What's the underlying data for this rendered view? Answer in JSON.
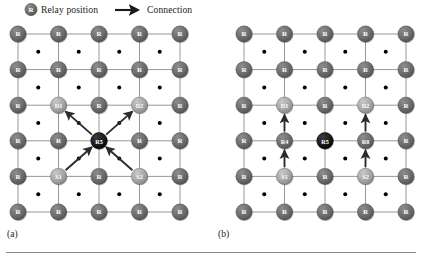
{
  "figure": {
    "legend": {
      "relay_icon_label": "R",
      "relay_label": "Relay position",
      "connection_arrow_icon": "arrow-right-icon",
      "connection_label": "Connection"
    },
    "panels": [
      {
        "id": "a",
        "caption": "(a)",
        "grid": {
          "cols": 5,
          "rows": 6
        },
        "nodes": [
          {
            "label": "R",
            "col": 0,
            "row": 0,
            "kind": "relay"
          },
          {
            "label": "R",
            "col": 1,
            "row": 0,
            "kind": "relay"
          },
          {
            "label": "R",
            "col": 2,
            "row": 0,
            "kind": "relay"
          },
          {
            "label": "R",
            "col": 3,
            "row": 0,
            "kind": "relay"
          },
          {
            "label": "R",
            "col": 4,
            "row": 0,
            "kind": "relay"
          },
          {
            "label": "R",
            "col": 0,
            "row": 1,
            "kind": "relay"
          },
          {
            "label": "R",
            "col": 1,
            "row": 1,
            "kind": "relay"
          },
          {
            "label": "R",
            "col": 2,
            "row": 1,
            "kind": "relay"
          },
          {
            "label": "R",
            "col": 3,
            "row": 1,
            "kind": "relay"
          },
          {
            "label": "R",
            "col": 4,
            "row": 1,
            "kind": "relay"
          },
          {
            "label": "R",
            "col": 0,
            "row": 2,
            "kind": "relay"
          },
          {
            "label": "D1",
            "col": 1,
            "row": 2,
            "kind": "destination"
          },
          {
            "label": "R",
            "col": 2,
            "row": 2,
            "kind": "relay"
          },
          {
            "label": "D2",
            "col": 3,
            "row": 2,
            "kind": "destination"
          },
          {
            "label": "R",
            "col": 4,
            "row": 2,
            "kind": "relay"
          },
          {
            "label": "R",
            "col": 0,
            "row": 3,
            "kind": "relay"
          },
          {
            "label": "R",
            "col": 1,
            "row": 3,
            "kind": "relay"
          },
          {
            "label": "R5",
            "col": 2,
            "row": 3,
            "kind": "active-relay"
          },
          {
            "label": "R",
            "col": 3,
            "row": 3,
            "kind": "relay"
          },
          {
            "label": "R",
            "col": 4,
            "row": 3,
            "kind": "relay"
          },
          {
            "label": "R",
            "col": 0,
            "row": 4,
            "kind": "relay"
          },
          {
            "label": "S1",
            "col": 1,
            "row": 4,
            "kind": "source"
          },
          {
            "label": "R",
            "col": 2,
            "row": 4,
            "kind": "relay"
          },
          {
            "label": "S2",
            "col": 3,
            "row": 4,
            "kind": "source"
          },
          {
            "label": "R",
            "col": 4,
            "row": 4,
            "kind": "relay"
          },
          {
            "label": "R",
            "col": 0,
            "row": 5,
            "kind": "relay"
          },
          {
            "label": "R",
            "col": 1,
            "row": 5,
            "kind": "relay"
          },
          {
            "label": "R",
            "col": 2,
            "row": 5,
            "kind": "relay"
          },
          {
            "label": "R",
            "col": 3,
            "row": 5,
            "kind": "relay"
          },
          {
            "label": "R",
            "col": 4,
            "row": 5,
            "kind": "relay"
          }
        ],
        "arrows": [
          {
            "from": "S1",
            "to": "R5",
            "from_col": 1,
            "from_row": 4,
            "to_col": 2,
            "to_row": 3
          },
          {
            "from": "S2",
            "to": "R5",
            "from_col": 3,
            "from_row": 4,
            "to_col": 2,
            "to_row": 3
          },
          {
            "from": "R5",
            "to": "D1",
            "from_col": 2,
            "from_row": 3,
            "to_col": 1,
            "to_row": 2
          },
          {
            "from": "R5",
            "to": "D2",
            "from_col": 2,
            "from_row": 3,
            "to_col": 3,
            "to_row": 2
          }
        ]
      },
      {
        "id": "b",
        "caption": "(b)",
        "grid": {
          "cols": 5,
          "rows": 6
        },
        "nodes": [
          {
            "label": "R",
            "col": 0,
            "row": 0,
            "kind": "relay"
          },
          {
            "label": "R",
            "col": 1,
            "row": 0,
            "kind": "relay"
          },
          {
            "label": "R",
            "col": 2,
            "row": 0,
            "kind": "relay"
          },
          {
            "label": "R",
            "col": 3,
            "row": 0,
            "kind": "relay"
          },
          {
            "label": "R",
            "col": 4,
            "row": 0,
            "kind": "relay"
          },
          {
            "label": "R",
            "col": 0,
            "row": 1,
            "kind": "relay"
          },
          {
            "label": "R",
            "col": 1,
            "row": 1,
            "kind": "relay"
          },
          {
            "label": "R",
            "col": 2,
            "row": 1,
            "kind": "relay"
          },
          {
            "label": "R",
            "col": 3,
            "row": 1,
            "kind": "relay"
          },
          {
            "label": "R",
            "col": 4,
            "row": 1,
            "kind": "relay"
          },
          {
            "label": "R",
            "col": 0,
            "row": 2,
            "kind": "relay"
          },
          {
            "label": "D1",
            "col": 1,
            "row": 2,
            "kind": "destination"
          },
          {
            "label": "R",
            "col": 2,
            "row": 2,
            "kind": "relay"
          },
          {
            "label": "D2",
            "col": 3,
            "row": 2,
            "kind": "destination"
          },
          {
            "label": "R",
            "col": 4,
            "row": 2,
            "kind": "relay"
          },
          {
            "label": "R",
            "col": 0,
            "row": 3,
            "kind": "relay"
          },
          {
            "label": "R4",
            "col": 1,
            "row": 3,
            "kind": "relay"
          },
          {
            "label": "R5",
            "col": 2,
            "row": 3,
            "kind": "active-relay"
          },
          {
            "label": "R8",
            "col": 3,
            "row": 3,
            "kind": "relay"
          },
          {
            "label": "R",
            "col": 4,
            "row": 3,
            "kind": "relay"
          },
          {
            "label": "R",
            "col": 0,
            "row": 4,
            "kind": "relay"
          },
          {
            "label": "S1",
            "col": 1,
            "row": 4,
            "kind": "source"
          },
          {
            "label": "R",
            "col": 2,
            "row": 4,
            "kind": "relay"
          },
          {
            "label": "S2",
            "col": 3,
            "row": 4,
            "kind": "source"
          },
          {
            "label": "R",
            "col": 4,
            "row": 4,
            "kind": "relay"
          },
          {
            "label": "R",
            "col": 0,
            "row": 5,
            "kind": "relay"
          },
          {
            "label": "R",
            "col": 1,
            "row": 5,
            "kind": "relay"
          },
          {
            "label": "R",
            "col": 2,
            "row": 5,
            "kind": "relay"
          },
          {
            "label": "R",
            "col": 3,
            "row": 5,
            "kind": "relay"
          },
          {
            "label": "R",
            "col": 4,
            "row": 5,
            "kind": "relay"
          }
        ],
        "arrows": [
          {
            "from": "S1",
            "to": "R4",
            "from_col": 1,
            "from_row": 4,
            "to_col": 1,
            "to_row": 3
          },
          {
            "from": "R4",
            "to": "D1",
            "from_col": 1,
            "from_row": 3,
            "to_col": 1,
            "to_row": 2
          },
          {
            "from": "S2",
            "to": "R8",
            "from_col": 3,
            "from_row": 4,
            "to_col": 3,
            "to_row": 3
          },
          {
            "from": "R8",
            "to": "D2",
            "from_col": 3,
            "from_row": 3,
            "to_col": 3,
            "to_row": 2
          }
        ]
      }
    ],
    "colors": {
      "relay_fill": "#6e6e6e",
      "active_relay_fill": "#1a1a1a",
      "endpoint_fill": "#a8a8a8",
      "grid_line": "#8c8c8c",
      "cell_dot": "#000000",
      "arrow": "#2b2b2b",
      "separator": "#8a8a8a",
      "text": "#1c1a1a"
    }
  }
}
